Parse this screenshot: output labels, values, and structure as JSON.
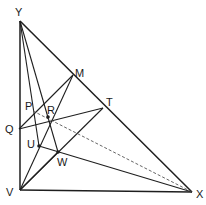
{
  "diagram": {
    "type": "geometry",
    "points": {
      "Y": {
        "label": "Y",
        "x": 20,
        "y": 21
      },
      "V": {
        "label": "V",
        "x": 20,
        "y": 190
      },
      "X": {
        "label": "X",
        "x": 192,
        "y": 192
      },
      "M": {
        "label": "M",
        "x": 73,
        "y": 75
      },
      "T": {
        "label": "T",
        "x": 103,
        "y": 108
      },
      "Q": {
        "label": "Q",
        "x": 19,
        "y": 129
      },
      "P": {
        "label": "P",
        "x": 33,
        "y": 111
      },
      "R": {
        "label": "R",
        "x": 48,
        "y": 116
      },
      "U": {
        "label": "U",
        "x": 39,
        "y": 146
      },
      "W": {
        "label": "W",
        "x": 58,
        "y": 152
      }
    },
    "labels": [
      "Y",
      "M",
      "P",
      "R",
      "T",
      "Q",
      "U",
      "W",
      "V",
      "X"
    ],
    "segments": [
      [
        "Y",
        "V"
      ],
      [
        "V",
        "X"
      ],
      [
        "Y",
        "X"
      ],
      [
        "Y",
        "U"
      ],
      [
        "Y",
        "W"
      ],
      [
        "M",
        "Q"
      ],
      [
        "M",
        "V"
      ],
      [
        "T",
        "Q"
      ],
      [
        "T",
        "V"
      ],
      [
        "U",
        "X"
      ],
      [
        "W",
        "V"
      ]
    ],
    "dashed_segments": [
      [
        "P",
        "X"
      ]
    ]
  }
}
